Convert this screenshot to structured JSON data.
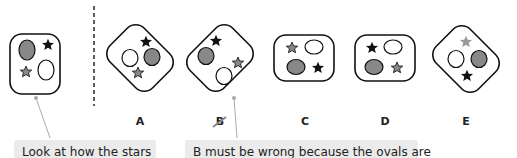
{
  "figure": {
    "reference": {
      "label": "",
      "items": [
        {
          "shape": "oval",
          "fill": "gray",
          "position": "top-left"
        },
        {
          "shape": "star",
          "fill": "black",
          "position": "top-right"
        },
        {
          "shape": "star",
          "fill": "gray",
          "position": "bottom-left"
        },
        {
          "shape": "oval",
          "fill": "white",
          "position": "bottom-right"
        }
      ]
    },
    "options": [
      {
        "label": "A",
        "rotation": "diagonal",
        "crossed_out": false
      },
      {
        "label": "B",
        "rotation": "diagonal",
        "crossed_out": true
      },
      {
        "label": "C",
        "rotation": "upright",
        "crossed_out": false
      },
      {
        "label": "D",
        "rotation": "upright",
        "crossed_out": false
      },
      {
        "label": "E",
        "rotation": "diagonal",
        "crossed_out": false
      }
    ]
  },
  "callouts": {
    "left": "Look at how the stars",
    "right": "B must be wrong because the ovals are"
  },
  "colors": {
    "gray_fill": "#888888",
    "light_gray_star": "#999999",
    "black": "#111111",
    "callout_bg": "#ebebeb",
    "pointer_line": "#aaaaaa"
  }
}
